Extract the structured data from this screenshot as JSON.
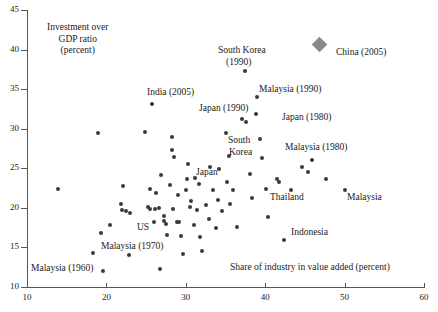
{
  "chart_data": {
    "type": "scatter",
    "title": "",
    "xlabel": "Share of industry in value added (percent)",
    "ylabel": "Investment over GDP ratio (percent)",
    "ylabel_lines": [
      "Investment over",
      "GDP ratio",
      "(percent)"
    ],
    "xlim": [
      10,
      60
    ],
    "ylim": [
      10,
      45
    ],
    "xticks": [
      10,
      20,
      30,
      40,
      50,
      60
    ],
    "yticks": [
      10,
      15,
      20,
      25,
      30,
      35,
      40,
      45
    ],
    "grid": false,
    "legend": "none",
    "series": [
      {
        "name": "countries",
        "marker": "circle",
        "color": "#3a3a3a",
        "points": [
          {
            "x": 13.9,
            "y": 22.4
          },
          {
            "x": 19.0,
            "y": 29.5
          },
          {
            "x": 18.3,
            "y": 14.3
          },
          {
            "x": 19.6,
            "y": 12.0
          },
          {
            "x": 20.4,
            "y": 17.8
          },
          {
            "x": 19.3,
            "y": 16.8
          },
          {
            "x": 22.1,
            "y": 22.8
          },
          {
            "x": 21.9,
            "y": 20.5
          },
          {
            "x": 22.0,
            "y": 19.7
          },
          {
            "x": 22.5,
            "y": 19.6
          },
          {
            "x": 23.0,
            "y": 19.4
          },
          {
            "x": 22.9,
            "y": 14.0
          },
          {
            "x": 24.9,
            "y": 29.6
          },
          {
            "x": 25.7,
            "y": 33.1
          },
          {
            "x": 25.5,
            "y": 22.4
          },
          {
            "x": 25.3,
            "y": 20.1
          },
          {
            "x": 25.5,
            "y": 19.9
          },
          {
            "x": 26.1,
            "y": 19.9
          },
          {
            "x": 26.6,
            "y": 20.0
          },
          {
            "x": 26.2,
            "y": 21.9
          },
          {
            "x": 26.0,
            "y": 18.2
          },
          {
            "x": 26.9,
            "y": 24.1
          },
          {
            "x": 26.8,
            "y": 12.3
          },
          {
            "x": 27.3,
            "y": 19.0
          },
          {
            "x": 27.2,
            "y": 18.4
          },
          {
            "x": 27.5,
            "y": 17.9
          },
          {
            "x": 27.6,
            "y": 16.6
          },
          {
            "x": 28.3,
            "y": 28.9
          },
          {
            "x": 28.2,
            "y": 27.3
          },
          {
            "x": 28.5,
            "y": 26.4
          },
          {
            "x": 28.0,
            "y": 22.9
          },
          {
            "x": 28.4,
            "y": 19.8
          },
          {
            "x": 28.9,
            "y": 18.2
          },
          {
            "x": 29.2,
            "y": 18.2
          },
          {
            "x": 29.0,
            "y": 21.6
          },
          {
            "x": 29.4,
            "y": 16.4
          },
          {
            "x": 29.6,
            "y": 14.2
          },
          {
            "x": 30.3,
            "y": 25.6
          },
          {
            "x": 30.1,
            "y": 23.7
          },
          {
            "x": 30.0,
            "y": 22.2
          },
          {
            "x": 30.6,
            "y": 20.9
          },
          {
            "x": 30.5,
            "y": 20.1
          },
          {
            "x": 31.2,
            "y": 23.8
          },
          {
            "x": 31.6,
            "y": 23.0
          },
          {
            "x": 31.4,
            "y": 19.7
          },
          {
            "x": 31.0,
            "y": 17.8
          },
          {
            "x": 31.8,
            "y": 16.3
          },
          {
            "x": 32.1,
            "y": 14.6
          },
          {
            "x": 32.6,
            "y": 20.3
          },
          {
            "x": 33.1,
            "y": 25.1
          },
          {
            "x": 33.4,
            "y": 22.2
          },
          {
            "x": 32.9,
            "y": 18.6
          },
          {
            "x": 33.8,
            "y": 17.5
          },
          {
            "x": 34.2,
            "y": 24.9
          },
          {
            "x": 34.0,
            "y": 21.0
          },
          {
            "x": 34.6,
            "y": 19.6
          },
          {
            "x": 35.0,
            "y": 29.4
          },
          {
            "x": 35.4,
            "y": 26.6
          },
          {
            "x": 35.2,
            "y": 23.3
          },
          {
            "x": 35.6,
            "y": 20.5
          },
          {
            "x": 36.0,
            "y": 22.3
          },
          {
            "x": 36.4,
            "y": 17.6
          },
          {
            "x": 37.4,
            "y": 37.3
          },
          {
            "x": 37.1,
            "y": 31.2
          },
          {
            "x": 37.6,
            "y": 30.8
          },
          {
            "x": 38.1,
            "y": 24.3
          },
          {
            "x": 38.4,
            "y": 21.3
          },
          {
            "x": 38.8,
            "y": 31.9
          },
          {
            "x": 39.3,
            "y": 28.7
          },
          {
            "x": 39.0,
            "y": 34.0
          },
          {
            "x": 39.6,
            "y": 26.3
          },
          {
            "x": 40.1,
            "y": 22.4
          },
          {
            "x": 40.4,
            "y": 18.8
          },
          {
            "x": 41.5,
            "y": 23.6
          },
          {
            "x": 41.8,
            "y": 23.3
          },
          {
            "x": 42.4,
            "y": 16.0
          },
          {
            "x": 43.2,
            "y": 22.3
          },
          {
            "x": 44.6,
            "y": 25.1
          },
          {
            "x": 45.4,
            "y": 24.5
          },
          {
            "x": 45.9,
            "y": 26.0
          },
          {
            "x": 47.6,
            "y": 23.6
          },
          {
            "x": 50.1,
            "y": 22.3
          }
        ]
      },
      {
        "name": "China (2005)",
        "marker": "diamond",
        "color": "#8a8a8a",
        "points": [
          {
            "x": 46.8,
            "y": 40.6
          }
        ]
      }
    ],
    "annotations": [
      {
        "text": "South Korea",
        "x": 218,
        "y": 45
      },
      {
        "text": "(1990)",
        "x": 226,
        "y": 57
      },
      {
        "text": "China (2005)",
        "x": 336,
        "y": 47
      },
      {
        "text": "India (2005)",
        "x": 147,
        "y": 87
      },
      {
        "text": "Malaysia (1990)",
        "x": 259,
        "y": 84
      },
      {
        "text": "Japan (1990)",
        "x": 199,
        "y": 103
      },
      {
        "text": "Japan (1980)",
        "x": 282,
        "y": 112
      },
      {
        "text": "Malaysia (1980)",
        "x": 285,
        "y": 142
      },
      {
        "text": "South",
        "x": 228,
        "y": 135
      },
      {
        "text": "Korea",
        "x": 229,
        "y": 147
      },
      {
        "text": "Japan",
        "x": 196,
        "y": 167
      },
      {
        "text": "Thailand",
        "x": 270,
        "y": 192
      },
      {
        "text": "Malaysia",
        "x": 347,
        "y": 192
      },
      {
        "text": "US",
        "x": 137,
        "y": 222
      },
      {
        "text": "Indonesia",
        "x": 291,
        "y": 227
      },
      {
        "text": "Malaysia (1970)",
        "x": 101,
        "y": 241
      },
      {
        "text": "Malaysia (1960)",
        "x": 31,
        "y": 263
      }
    ]
  },
  "axis": {
    "x_title": "Share of industry in value added (percent)",
    "y_title_lines": [
      "Investment over",
      "GDP ratio",
      "(percent)"
    ]
  }
}
